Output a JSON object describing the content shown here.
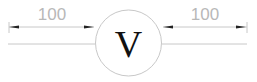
{
  "diagram": {
    "symbol": {
      "label": "V",
      "type": "voltmeter"
    },
    "left_dimension": {
      "label": "100"
    },
    "right_dimension": {
      "label": "100"
    },
    "colors": {
      "line": "#c8c8c8",
      "arrow": "#222222",
      "dim_text": "#b8b8b8",
      "symbol_text": "#111111"
    }
  }
}
